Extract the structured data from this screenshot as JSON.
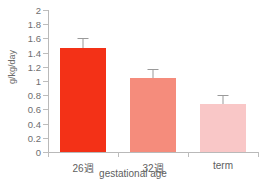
{
  "chart_data": {
    "type": "bar",
    "title": "",
    "xlabel": "gestational age",
    "ylabel": "g/kg/day",
    "categories": [
      "26週",
      "32週",
      "term"
    ],
    "values": [
      1.46,
      1.04,
      0.68
    ],
    "errors": [
      0.14,
      0.13,
      0.12
    ],
    "error_type": "upper-only",
    "ylim": [
      0,
      2
    ],
    "ytick_values": [
      0,
      0.2,
      0.4,
      0.6,
      0.8,
      1,
      1.2,
      1.4,
      1.6,
      1.8,
      2
    ],
    "ytick_labels": [
      "0",
      "0.2",
      "0.4",
      "0.6",
      "0.8",
      "1",
      "1.2",
      "1.4",
      "1.6",
      "1.8",
      "2"
    ],
    "grid": false,
    "legend": "none",
    "series": [
      {
        "name": "protein accretion",
        "values": [
          1.46,
          1.04,
          0.68
        ]
      }
    ],
    "bar_colors": [
      "#f33117",
      "#f58c7c",
      "#f9c7c7"
    ],
    "axis_color": "#b9b9b9",
    "error_bar_color": "#9a9a9a",
    "text_color": "#5e5e5e"
  },
  "axes": {
    "y_title": "g/kg/day",
    "x_title": "gestational age"
  }
}
